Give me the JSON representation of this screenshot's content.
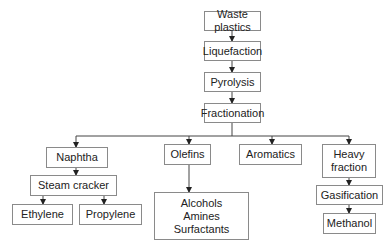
{
  "diagram": {
    "type": "flowchart",
    "nodes": {
      "waste_plastics": "Waste plastics",
      "liquefaction": "Liquefaction",
      "pyrolysis": "Pyrolysis",
      "fractionation": "Fractionation",
      "naphtha": "Naphtha",
      "olefins": "Olefins",
      "aromatics": "Aromatics",
      "heavy_fraction": [
        "Heavy",
        "fraction"
      ],
      "steam_cracker": "Steam cracker",
      "ethylene": "Ethylene",
      "propylene": "Propylene",
      "olefin_products": [
        "Alcohols",
        "Amines",
        "Surfactants"
      ],
      "gasification": "Gasification",
      "methanol": "Methanol"
    },
    "edges": [
      [
        "Waste plastics",
        "Liquefaction"
      ],
      [
        "Liquefaction",
        "Pyrolysis"
      ],
      [
        "Pyrolysis",
        "Fractionation"
      ],
      [
        "Fractionation",
        "Naphtha"
      ],
      [
        "Fractionation",
        "Olefins"
      ],
      [
        "Fractionation",
        "Aromatics"
      ],
      [
        "Fractionation",
        "Heavy fraction"
      ],
      [
        "Naphtha",
        "Steam cracker"
      ],
      [
        "Steam cracker",
        "Ethylene"
      ],
      [
        "Steam cracker",
        "Propylene"
      ],
      [
        "Olefins",
        "Alcohols / Amines / Surfactants"
      ],
      [
        "Heavy fraction",
        "Gasification"
      ],
      [
        "Gasification",
        "Methanol"
      ]
    ],
    "colors": {
      "line": "#333333",
      "border": "#8a8a8a",
      "text": "#222222"
    }
  }
}
